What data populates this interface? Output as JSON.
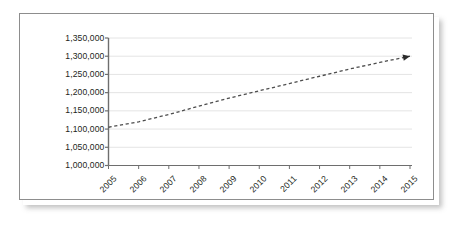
{
  "chart_data": {
    "type": "line",
    "title": "",
    "subtitle": "",
    "xlabel": "",
    "ylabel": "",
    "x": [
      2005,
      2006,
      2007,
      2008,
      2009,
      2010,
      2011,
      2012,
      2013,
      2014,
      2015
    ],
    "xtick_labels": [
      "2005",
      "2006",
      "2007",
      "2008",
      "2009",
      "2010",
      "2011",
      "2012",
      "2013",
      "2014",
      "2015"
    ],
    "ytick_labels": [
      "1,350,000",
      "1,300,000",
      "1,250,000",
      "1,200,000",
      "1,150,000",
      "1,100,000",
      "1,050,000",
      "1,000,000"
    ],
    "ytick_values": [
      1350000,
      1300000,
      1250000,
      1200000,
      1150000,
      1100000,
      1050000,
      1000000
    ],
    "ylim": [
      1000000,
      1350000
    ],
    "xlim": [
      2005,
      2015
    ],
    "grid": "horizontal",
    "legend": "none",
    "series": [
      {
        "name": "trend",
        "style": "dashed",
        "color": "#4d4d4d",
        "marker": "none",
        "end_marker": "arrow",
        "values": [
          1105000,
          1120000,
          1140000,
          1163000,
          1185000,
          1205000,
          1225000,
          1245000,
          1265000,
          1283000,
          1300000
        ]
      }
    ],
    "annotations": []
  },
  "figure": {
    "frame_color": "#8d8d8d",
    "background_color": "#ffffff",
    "gridline_color": "#e4e4e4",
    "axis_color": "#6e6e6e",
    "line_color": "#4d4d4d"
  }
}
